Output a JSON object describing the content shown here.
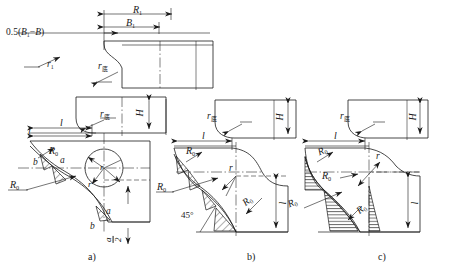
{
  "figure": {
    "type": "engineering-drawing",
    "background_color": "#ffffff",
    "line_color": "#1a1a1a"
  },
  "panels": [
    {
      "id": "a",
      "caption": "a)"
    },
    {
      "id": "b",
      "caption": "b)"
    },
    {
      "id": "c",
      "caption": "c)"
    }
  ],
  "labels": {
    "offset_expr_prefix": "0.5(",
    "offset_expr_B1": "B",
    "offset_expr_sub1": "1",
    "offset_expr_mid": "−",
    "offset_expr_B": "B",
    "offset_expr_suffix": ")",
    "R_major": "R",
    "R_major_sub": "1",
    "B_major": "B",
    "B_major_sub": "1",
    "r_small": "r",
    "r_small_sub": "1",
    "r_bottom": "r",
    "r_bottom_sub": "底",
    "H": "H",
    "l": "l",
    "R_zero": "R",
    "R_zero_sub": "0",
    "r": "r",
    "a": "a",
    "b": "b",
    "angle_45": "45°",
    "frac_num": "a",
    "frac_den": "2"
  },
  "top_view": {
    "dimensions": [
      "R1",
      "B1",
      "0.5(B1−B)"
    ],
    "fillets": [
      "r1",
      "r底"
    ]
  },
  "middle_view": {
    "dimensions": [
      "H",
      "l"
    ],
    "fillets": [
      "r底"
    ]
  },
  "panel_a": {
    "radii": [
      "R0",
      "R0"
    ],
    "angles": [
      "a",
      "a",
      "b",
      "b"
    ],
    "center_radii": [
      "r",
      "c"
    ],
    "fraction": "a/2"
  },
  "panel_b": {
    "radii": [
      "R0",
      "R0",
      "R0"
    ],
    "fillets": [
      "r",
      "r底"
    ],
    "dimensions": [
      "l",
      "l",
      "H"
    ],
    "angles": [
      "45°"
    ]
  },
  "panel_c": {
    "radii": [
      "R0",
      "R0",
      "R0",
      "R0"
    ],
    "fillets": [
      "r",
      "r底"
    ],
    "dimensions": [
      "l",
      "l",
      "H"
    ]
  }
}
